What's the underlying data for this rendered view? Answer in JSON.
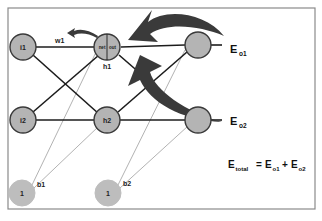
{
  "diagram": {
    "nodes": {
      "i1": "i1",
      "i2": "i2",
      "h1": "h1",
      "h1_net": "net",
      "h1_out": "out",
      "h2": "h2",
      "b1_node": "1",
      "b2_node": "1"
    },
    "labels": {
      "w1": "w1",
      "b1": "b1",
      "b2": "b2",
      "e_o1_main": "E",
      "e_o1_sub": "o1",
      "e_o2_main": "E",
      "e_o2_sub": "o2"
    },
    "equation": {
      "lhs_main": "E",
      "lhs_sub": "total",
      "equals": "=",
      "t1_main": "E",
      "t1_sub": "o1",
      "plus": "+",
      "t2_main": "E",
      "t2_sub": "o2"
    },
    "colors": {
      "node_fill": "#b4b4b4",
      "edge": "#1c1c1c",
      "arrow": "#3a3a3a",
      "bias_edge": "#a9a9a9"
    }
  }
}
